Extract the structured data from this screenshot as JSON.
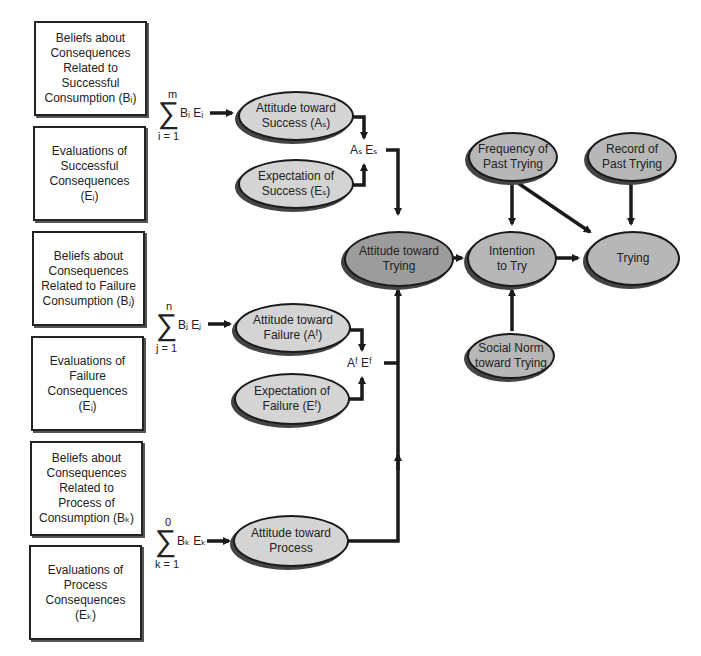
{
  "diagram": {
    "colors": {
      "line": "#1a1a1a",
      "ellipse_light": "#d4d4d4",
      "ellipse_mid": "#b7b7b7",
      "ellipse_dark": "#9c9c9c"
    },
    "boxes": [
      {
        "id": "beliefs-success",
        "text": "Beliefs about\nConsequences\nRelated to\nSuccessful\nConsumption (Bᵢ)"
      },
      {
        "id": "evaluations-success",
        "text": "Evaluations of\nSuccessful\nConsequences\n(Eᵢ)"
      },
      {
        "id": "beliefs-failure",
        "text": "Beliefs about\nConsequences\nRelated to Failure\nConsumption (Bⱼ)"
      },
      {
        "id": "evaluations-failure",
        "text": "Evaluations of\nFailure\nConsequences\n(Eⱼ)"
      },
      {
        "id": "beliefs-process",
        "text": "Beliefs about\nConsequences\nRelated to Process of\nConsumption (Bₖ)"
      },
      {
        "id": "evaluations-process",
        "text": "Evaluations of\nProcess\nConsequences\n(Eₖ)"
      }
    ],
    "sums": [
      {
        "upper": "m",
        "lower": "i = 1",
        "term": "Bᵢ Eᵢ"
      },
      {
        "upper": "n",
        "lower": "j = 1",
        "term": "Bⱼ Eⱼ"
      },
      {
        "upper": "0",
        "lower": "k = 1",
        "term": "Bₖ Eₖ"
      }
    ],
    "products": [
      {
        "label": "Aₛ Eₛ"
      },
      {
        "label": "Aᶠ Eᶠ"
      }
    ],
    "ellipses": {
      "attitude_success": "Attitude toward\nSuccess (Aₛ)",
      "expectation_success": "Expectation of\nSuccess (Eₛ)",
      "attitude_failure": "Attitude toward\nFailure (Aᶠ)",
      "expectation_failure": "Expectation of\nFailure (Eᶠ)",
      "attitude_process": "Attitude toward\nProcess",
      "attitude_trying": "Attitude toward\nTrying",
      "intention": "Intention\nto Try",
      "trying": "Trying",
      "frequency": "Frequency of\nPast Trying",
      "record": "Record of\nPast Trying",
      "social_norm": "Social Norm\ntoward Trying"
    }
  }
}
